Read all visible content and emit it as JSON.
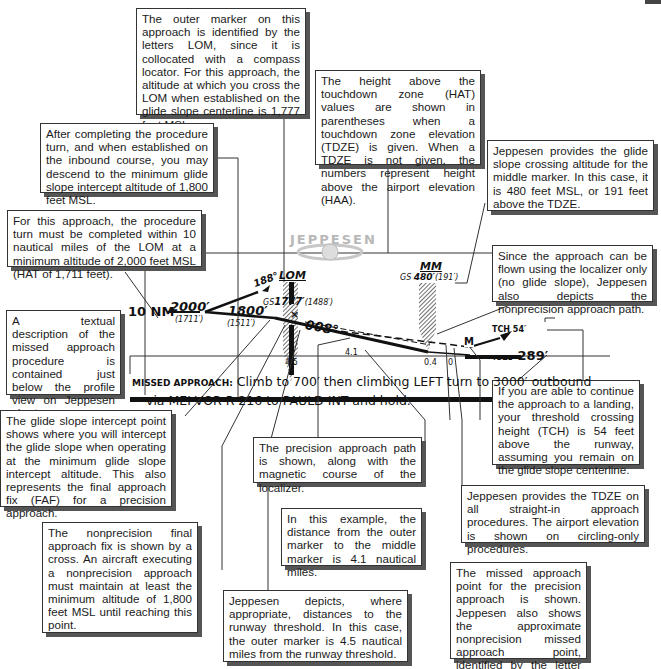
{
  "callouts": {
    "outer_marker": "The outer marker on this approach is identified by the letters LOM, since it is collocated with a compass locator. For this approach, the altitude at which you cross the LOM when established on the glide slope centerline is 1,777 feet MSL.",
    "hat": "The height above the touchdown zone (HAT) values are shown in parentheses when a touchdown zone elevation (TDZE) is given. When a TDZE is not given, the numbers represent height above the airport elevation (HAA).",
    "procedure_turn_descend": "After completing the procedure turn, and when established on the inbound course, you may descend to the minimum glide slope intercept altitude of 1,800 feet MSL.",
    "middle_marker": "Jeppesen provides the glide slope crossing altitude for the middle marker. In this case, it is 480 feet MSL, or 191 feet above the TDZE.",
    "procedure_turn_limit": "For this approach, the procedure turn must be completed within 10 nautical miles of the LOM at a minimum altitude of 2,000 feet MSL (HAT of 1,711 feet).",
    "nonprecision_path": "Since the approach can be flown using the localizer only (no glide slope), Jeppesen also depicts the nonprecision approach path.",
    "missed_text": "A textual description of the missed approach procedure is contained just below the profile view on Jeppesen charts.",
    "tch": "If you are able to continue the approach to a landing, your threshold crossing height (TCH) is 54 feet above the runway, assuming you remain on the glide slope centerline.",
    "gs_intercept": "The glide slope intercept point shows where you will intercept the glide slope when operating at the minimum glide slope intercept altitude. This also represents the final approach fix (FAF) for a precision approach.",
    "precision_path": "The precision approach path is shown, along with the magnetic course of the localizer.",
    "tdze": "Jeppesen provides the TDZE on all straight-in approach procedures. The airport elevation is shown on circling-only procedures.",
    "om_to_mm": "In this example, the distance from the outer marker to the middle marker is 4.1 nautical miles.",
    "nonprecision_faf": "The nonprecision final approach fix is shown by a cross. An aircraft executing a nonprecision approach must maintain at least the minimum altitude of 1,800 feet MSL until reaching this point.",
    "map": "The missed approach point for the precision approach is shown. Jeppesen also shows the approximate nonprecision missed approach point, identified by the letter M.",
    "threshold_distances": "Jeppesen depicts, where appropriate, distances to the runway threshold. In this case, the outer marker is 4.5 nautical miles from the runway threshold."
  },
  "profile": {
    "logo": "JEPPESEN",
    "pt_distance": "10 NM",
    "pt_alt": "2000′",
    "pt_hat": "(1711′)",
    "pt_course": "188°",
    "gsi_alt": "1800′",
    "gsi_hat": "(1511′)",
    "lom_label": "LOM",
    "lom_gs_prefix": "GS",
    "lom_gs_alt": "1777′",
    "lom_gs_hat": "(1488′)",
    "loc_course": "008°",
    "mm_label": "MM",
    "mm_gs_prefix": "GS",
    "mm_gs_alt": "480′",
    "mm_gs_hat": "(191′)",
    "map_letter": "M",
    "tch": "TCH 54′",
    "tdze_prefix": "TDZE",
    "tdze_value": "289′",
    "dist_om": "4.5",
    "dist_om_mm": "4.1",
    "dist_mm": "0.4",
    "dist_thr": "0",
    "missed_prefix": "MISSED APPROACH:",
    "missed_line1": "Climb to 700′ then climbing LEFT turn to 3000′ outbound",
    "missed_line2": "via MEI VOR R-216 to PAULD INT and hold."
  }
}
